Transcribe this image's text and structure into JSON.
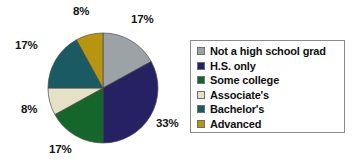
{
  "chart_data": {
    "type": "pie",
    "title": "",
    "xlabel": "",
    "ylabel": "",
    "legend_position": "right",
    "grid": false,
    "categories": [
      "Not a high school grad",
      "H.S. only",
      "Some college",
      "Associate's",
      "Bachelor's",
      "Advanced"
    ],
    "values": [
      17,
      33,
      17,
      8,
      17,
      8
    ],
    "value_labels": [
      "17%",
      "33%",
      "17%",
      "8%",
      "17%",
      "8%"
    ],
    "colors": [
      "#9ba3a6",
      "#262163",
      "#15662b",
      "#e5e2c8",
      "#1a5b63",
      "#b8950f"
    ],
    "slice_order": "clockwise-from-top"
  },
  "pie": {
    "labels": [
      {
        "text": "17%",
        "name": "slice-label-not-a-high-school-grad",
        "left": 131,
        "top": 14
      },
      {
        "text": "33%",
        "name": "slice-label-hs-only",
        "left": 156,
        "top": 118
      },
      {
        "text": "17%",
        "name": "slice-label-some-college",
        "left": 49,
        "top": 144
      },
      {
        "text": "8%",
        "name": "slice-label-associates",
        "left": 21,
        "top": 104
      },
      {
        "text": "17%",
        "name": "slice-label-bachelors",
        "left": 15,
        "top": 40
      },
      {
        "text": "8%",
        "name": "slice-label-advanced",
        "left": 73,
        "top": 6
      }
    ]
  },
  "legend": {
    "items": [
      {
        "label": "Not a high school grad",
        "color": "#9ba3a6",
        "name": "legend-item-not-a-high-school-grad"
      },
      {
        "label": "H.S. only",
        "color": "#262163",
        "name": "legend-item-hs-only"
      },
      {
        "label": "Some college",
        "color": "#15662b",
        "name": "legend-item-some-college"
      },
      {
        "label": "Associate's",
        "color": "#e5e2c8",
        "name": "legend-item-associates"
      },
      {
        "label": "Bachelor's",
        "color": "#1a5b63",
        "name": "legend-item-bachelors"
      },
      {
        "label": "Advanced",
        "color": "#b8950f",
        "name": "legend-item-advanced"
      }
    ]
  }
}
